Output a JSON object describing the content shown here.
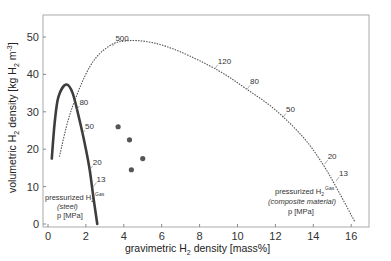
{
  "chart_data": {
    "type": "line",
    "title": "",
    "xlabel": "gravimetric H2 density [mass%]",
    "ylabel": "volumetric H2 density [kg H2 m^-3]",
    "xlim": [
      -0.3,
      17.2
    ],
    "ylim": [
      -1,
      55
    ],
    "x_ticks": [
      0,
      2,
      4,
      6,
      8,
      10,
      12,
      14,
      16
    ],
    "y_ticks": [
      0,
      10,
      20,
      30,
      40,
      50
    ],
    "grid": false,
    "series": [
      {
        "name": "pressurized H2 gas (steel)",
        "style": "solid thick",
        "points": [
          [
            0.2,
            17.5
          ],
          [
            0.35,
            27
          ],
          [
            0.55,
            34
          ],
          [
            0.95,
            37.3
          ],
          [
            1.3,
            35
          ],
          [
            1.7,
            27
          ],
          [
            2.0,
            20
          ],
          [
            2.2,
            14.5
          ],
          [
            2.4,
            7
          ],
          [
            2.6,
            0
          ]
        ],
        "pressure_labels": [
          {
            "p": "80",
            "x": 1.5,
            "y": 30.5
          },
          {
            "p": "50",
            "x": 1.8,
            "y": 24
          },
          {
            "p": "20",
            "x": 2.2,
            "y": 14.5
          },
          {
            "p": "13",
            "x": 2.4,
            "y": 10
          }
        ]
      },
      {
        "name": "pressurized H2 gas (composite material)",
        "style": "dotted",
        "points": [
          [
            0.6,
            18
          ],
          [
            1.2,
            30
          ],
          [
            2.2,
            42
          ],
          [
            3.2,
            47.5
          ],
          [
            4.2,
            49
          ],
          [
            5.5,
            48.5
          ],
          [
            7,
            46
          ],
          [
            9,
            41
          ],
          [
            10.5,
            36
          ],
          [
            12,
            30.5
          ],
          [
            13.5,
            23
          ],
          [
            14.5,
            16
          ],
          [
            15.3,
            9
          ],
          [
            16.2,
            0.5
          ]
        ],
        "pressure_labels": [
          {
            "p": "500",
            "x": 3.4,
            "y": 47.5
          },
          {
            "p": "120",
            "x": 8.8,
            "y": 41.5
          },
          {
            "p": "80",
            "x": 10.5,
            "y": 36
          },
          {
            "p": "50",
            "x": 12.4,
            "y": 28.5
          },
          {
            "p": "20",
            "x": 14.6,
            "y": 16
          },
          {
            "p": "13",
            "x": 15.2,
            "y": 11.5
          }
        ]
      },
      {
        "name": "other materials",
        "style": "scatter",
        "points": [
          [
            3.7,
            26
          ],
          [
            4.3,
            22.5
          ],
          [
            5.0,
            17.5
          ],
          [
            4.4,
            14.5
          ]
        ]
      }
    ],
    "annotations": [
      {
        "text": "pressurized H2 Gas (steel) p [MPa]",
        "position": "lower-left"
      },
      {
        "text": "pressurized H2 Gas (composite material) p [MPa]",
        "position": "lower-right"
      }
    ]
  },
  "axes": {
    "x_label_pre": "gravimetric H",
    "x_label_sub": "2",
    "x_label_post": " density [mass%]",
    "y_label_pre": "volumetric H",
    "y_label_sub": "2",
    "y_label_mid": " density [kg H",
    "y_label_sub2": "2",
    "y_label_post": " m",
    "y_label_sup": "-3",
    "y_label_end": "]"
  },
  "annotations": {
    "steel": {
      "line1": "pressurized H",
      "sub": "2",
      "sup": "Gas",
      "line2": "(steel)",
      "line3": "p [MPa]"
    },
    "composite": {
      "line1": "pressurized H",
      "sub": "2",
      "sup": "Gas",
      "line2": "(composite material)",
      "line3": "p [MPa]"
    }
  },
  "colors": {
    "steel": "#444444",
    "composite": "#555555",
    "points": "#555555",
    "axis": "#999999"
  }
}
